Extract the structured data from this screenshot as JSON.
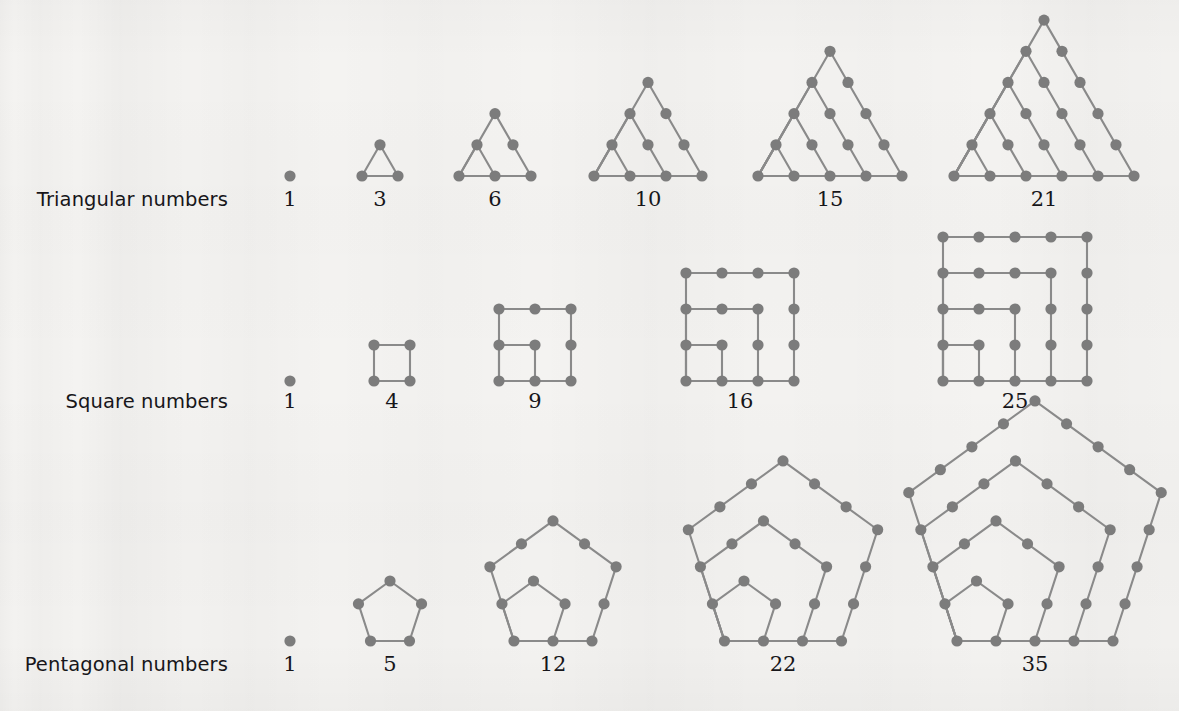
{
  "page": {
    "background_color": "#f4f3f1",
    "ink_color": "#17161a",
    "dot_color": "#7c7c7c",
    "line_color": "#8a8a8a",
    "width": 1179,
    "height": 711
  },
  "chart_data": {
    "type": "diagram",
    "rows": [
      {
        "label": "Triangular numbers",
        "shape": "triangle",
        "sides": 3,
        "formula": "n(n+1)/2",
        "terms": [
          {
            "index": 1,
            "value": "1",
            "number": 1,
            "dots": 1,
            "center_x": 290,
            "label_y": 206
          },
          {
            "index": 2,
            "value": "3",
            "number": 3,
            "dots": 3,
            "center_x": 380,
            "label_y": 206
          },
          {
            "index": 3,
            "value": "6",
            "number": 6,
            "dots": 6,
            "center_x": 495,
            "label_y": 206
          },
          {
            "index": 4,
            "value": "10",
            "number": 10,
            "dots": 10,
            "center_x": 648,
            "label_y": 206
          },
          {
            "index": 5,
            "value": "15",
            "number": 15,
            "dots": 15,
            "center_x": 830,
            "label_y": 206
          },
          {
            "index": 6,
            "value": "21",
            "number": 21,
            "dots": 21,
            "center_x": 1044,
            "label_y": 206
          }
        ],
        "label_x": 228,
        "label_y": 206,
        "baseline_y": 176,
        "step": 36
      },
      {
        "label": "Square numbers",
        "shape": "square",
        "sides": 4,
        "formula": "n^2",
        "terms": [
          {
            "index": 1,
            "value": "1",
            "number": 1,
            "dots": 1,
            "center_x": 290,
            "label_y": 408
          },
          {
            "index": 2,
            "value": "4",
            "number": 4,
            "dots": 4,
            "center_x": 392,
            "label_y": 408
          },
          {
            "index": 3,
            "value": "9",
            "number": 9,
            "dots": 9,
            "center_x": 535,
            "label_y": 408
          },
          {
            "index": 4,
            "value": "16",
            "number": 16,
            "dots": 16,
            "center_x": 740,
            "label_y": 408
          },
          {
            "index": 5,
            "value": "25",
            "number": 25,
            "dots": 25,
            "center_x": 1015,
            "label_y": 408
          }
        ],
        "label_x": 228,
        "label_y": 408,
        "baseline_y": 381,
        "step": 36
      },
      {
        "label": "Pentagonal numbers",
        "shape": "pentagon",
        "sides": 5,
        "formula": "n(3n-1)/2",
        "terms": [
          {
            "index": 1,
            "value": "1",
            "number": 1,
            "dots": 1,
            "center_x": 290,
            "label_y": 671
          },
          {
            "index": 2,
            "value": "5",
            "number": 5,
            "dots": 5,
            "center_x": 390,
            "label_y": 671
          },
          {
            "index": 3,
            "value": "12",
            "number": 12,
            "dots": 12,
            "center_x": 553,
            "label_y": 671
          },
          {
            "index": 4,
            "value": "22",
            "number": 22,
            "dots": 22,
            "center_x": 783,
            "label_y": 671
          },
          {
            "index": 5,
            "value": "35",
            "number": 35,
            "dots": 35,
            "center_x": 1035,
            "label_y": 671
          }
        ],
        "label_x": 228,
        "label_y": 671,
        "baseline_y": 641,
        "step": 39
      }
    ]
  }
}
